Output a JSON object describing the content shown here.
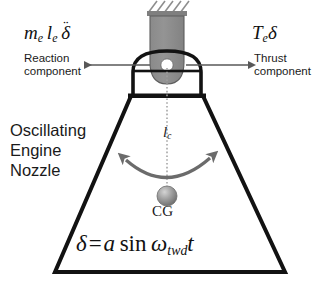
{
  "diagram": {
    "background_color": "#ffffff",
    "stroke_color": "#121212",
    "arrow_color": "#4a4a4a",
    "gimbal_fill": "#8f8f8f",
    "sphere_fill": "#9a9a9a",
    "centerline_color": "#9b9b9b"
  },
  "labels": {
    "reaction_formula": {
      "m": "m",
      "m_sub": "e",
      "l": "l",
      "l_sub": "e",
      "delta": "δ",
      "ddot": "¨"
    },
    "reaction_caption_line1": "Reaction",
    "reaction_caption_line2": "component",
    "thrust_formula": {
      "T": "T",
      "T_sub": "e",
      "delta": "δ"
    },
    "thrust_caption_line1": "Thrust",
    "thrust_caption_line2": "component",
    "nozzle_line1": "Oscillating",
    "nozzle_line2": "Engine",
    "nozzle_line3": "Nozzle",
    "lc_symbol": "l",
    "lc_subscript": "c",
    "cg_label": "CG",
    "equation": {
      "delta": "δ",
      "equals": "=",
      "a": "a",
      "sin": "sin",
      "omega": "ω",
      "omega_sub": "twd",
      "t": "t"
    }
  }
}
